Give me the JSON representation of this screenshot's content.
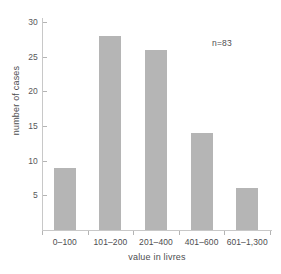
{
  "chart_data": {
    "type": "bar",
    "title": "",
    "subtitle": "",
    "xlabel": "value in livres",
    "ylabel": "number of cases",
    "categories": [
      "0–100",
      "101–200",
      "201–400",
      "401–600",
      "601–1,300"
    ],
    "values": [
      9,
      28,
      26,
      14,
      6
    ],
    "series": [
      {
        "name": "number of cases",
        "values": [
          9,
          28,
          26,
          14,
          6
        ]
      }
    ],
    "ylim": [
      0,
      30
    ],
    "y_ticks": [
      5,
      10,
      15,
      20,
      25,
      30
    ],
    "y_tick_labels": [
      "5",
      "10",
      "15",
      "20",
      "25",
      "30"
    ],
    "x_tick_labels": [
      "0–100",
      "101–200",
      "201–400",
      "401–600",
      "601–1,300"
    ],
    "annotations": [
      {
        "text": "n=83",
        "x": 212,
        "y": 39
      }
    ],
    "grid": false,
    "legend": false,
    "legend_position": "none",
    "bar_color": "#b5b5b5",
    "axis_color": "#c8c8c8",
    "text_color": "#4d4d4f",
    "background_color": "#ffffff"
  },
  "annotation": {
    "sample_size": "n=83"
  },
  "axes": {
    "x_title": "value in livres",
    "y_title": "number of cases"
  }
}
